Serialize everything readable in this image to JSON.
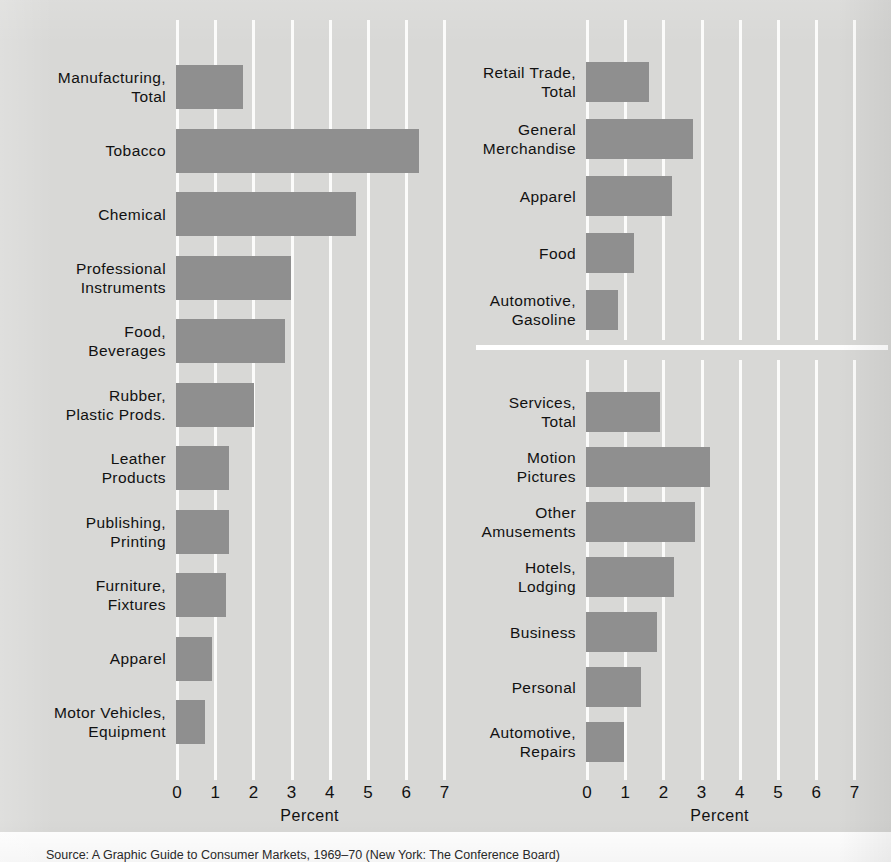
{
  "figure": {
    "source_note": "Source: A Graphic Guide to Consumer Markets, 1969–70 (New York: The Conference Board)",
    "bar_color": "#8f8f8f",
    "background_color": "#d8d8d6",
    "gridline_color": "#fbfbfa"
  },
  "chart_data": [
    {
      "type": "bar",
      "id": "manufacturing",
      "orientation": "horizontal",
      "title": "",
      "xlabel": "Percent",
      "ylabel": "",
      "xlim": [
        0,
        7
      ],
      "xticks": [
        "0",
        "1",
        "2",
        "3",
        "4",
        "5",
        "6",
        "7"
      ],
      "grid": true,
      "legend": "none",
      "categories": [
        "Manufacturing,\nTotal",
        "Tobacco",
        "Chemical",
        "Professional\nInstruments",
        "Food,\nBeverages",
        "Rubber,\nPlastic Prods.",
        "Leather\nProducts",
        "Publishing,\nPrinting",
        "Furniture,\nFixtures",
        "Apparel",
        "Motor Vehicles,\nEquipment"
      ],
      "values": [
        1.75,
        6.35,
        4.7,
        3.0,
        2.85,
        2.05,
        1.4,
        1.4,
        1.3,
        0.95,
        0.75
      ]
    },
    {
      "type": "bar",
      "id": "retail-trade",
      "orientation": "horizontal",
      "title": "",
      "xlabel": "Percent",
      "ylabel": "",
      "xlim": [
        0,
        7
      ],
      "xticks": [
        "0",
        "1",
        "2",
        "3",
        "4",
        "5",
        "6",
        "7"
      ],
      "grid": true,
      "legend": "none",
      "categories": [
        "Retail Trade,\nTotal",
        "General\nMerchandise",
        "Apparel",
        "Food",
        "Automotive,\nGasoline"
      ],
      "values": [
        1.65,
        2.8,
        2.25,
        1.25,
        0.85
      ]
    },
    {
      "type": "bar",
      "id": "services",
      "orientation": "horizontal",
      "title": "",
      "xlabel": "Percent",
      "ylabel": "",
      "xlim": [
        0,
        7
      ],
      "xticks": [
        "0",
        "1",
        "2",
        "3",
        "4",
        "5",
        "6",
        "7"
      ],
      "grid": true,
      "legend": "none",
      "categories": [
        "Services,\nTotal",
        "Motion\nPictures",
        "Other\nAmusements",
        "Hotels,\nLodging",
        "Business",
        "Personal",
        "Automotive,\nRepairs"
      ],
      "values": [
        1.95,
        3.25,
        2.85,
        2.3,
        1.85,
        1.45,
        1.0
      ]
    }
  ],
  "left_axis": {
    "labels": [
      "0",
      "1",
      "2",
      "3",
      "4",
      "5",
      "6",
      "7"
    ],
    "title": "Percent"
  },
  "right_axis": {
    "labels": [
      "0",
      "1",
      "2",
      "3",
      "4",
      "5",
      "6",
      "7"
    ],
    "title": "Percent"
  }
}
